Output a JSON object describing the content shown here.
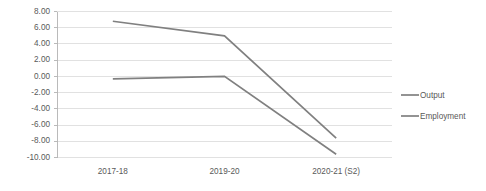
{
  "chart_data": {
    "type": "line",
    "title": "",
    "subtitle": "",
    "xlabel": "",
    "ylabel": "",
    "categories": [
      "2017-18",
      "2019-20",
      "2020-21 (S2)"
    ],
    "series": [
      {
        "name": "Output",
        "values": [
          6.8,
          5.0,
          -7.6
        ],
        "color": "#808080"
      },
      {
        "name": "Employment",
        "values": [
          -0.3,
          0.0,
          -9.6
        ],
        "color": "#808080"
      }
    ],
    "ylim": [
      -10.0,
      8.0
    ],
    "ytick_values": [
      8.0,
      6.0,
      4.0,
      2.0,
      0.0,
      -2.0,
      -4.0,
      -6.0,
      -8.0,
      -10.0
    ],
    "ytick_labels": [
      "8.00",
      "6.00",
      "4.00",
      "2.00",
      "0.00",
      "-2.00",
      "-4.00",
      "-6.00",
      "-8.00",
      "-10.00"
    ],
    "grid": true,
    "grid_axis": "y",
    "legend_position": "right",
    "legend_entries": [
      "Output",
      "Employment"
    ],
    "annotations": []
  },
  "colors": {
    "gridline": "#d9d9d9",
    "axis": "#b3b3b3",
    "text": "#595959",
    "background": "#ffffff",
    "series_output": "#808080",
    "series_employment": "#808080"
  },
  "axis": {
    "y_labels": {
      "t0": "8.00",
      "t1": "6.00",
      "t2": "4.00",
      "t3": "2.00",
      "t4": "0.00",
      "t5": "-2.00",
      "t6": "-4.00",
      "t7": "-6.00",
      "t8": "-8.00",
      "t9": "-10.00"
    },
    "x_labels": {
      "c0": "2017-18",
      "c1": "2019-20",
      "c2": "2020-21 (S2)"
    }
  },
  "legend": {
    "items": [
      {
        "label": "Output"
      },
      {
        "label": "Employment"
      }
    ]
  }
}
